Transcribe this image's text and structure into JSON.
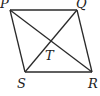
{
  "diagram": {
    "type": "quadrilateral-with-diagonals",
    "stroke_color": "#2a2a2a",
    "vertices": {
      "P": {
        "label": "P",
        "x": 10,
        "y": 10
      },
      "Q": {
        "label": "Q",
        "x": 77,
        "y": 10
      },
      "R": {
        "label": "R",
        "x": 92,
        "y": 72
      },
      "S": {
        "label": "S",
        "x": 25,
        "y": 72
      }
    },
    "intersection": {
      "label": "T",
      "x": 51,
      "y": 42
    },
    "labels": {
      "P": "P",
      "Q": "Q",
      "R": "R",
      "S": "S",
      "T": "T"
    }
  }
}
